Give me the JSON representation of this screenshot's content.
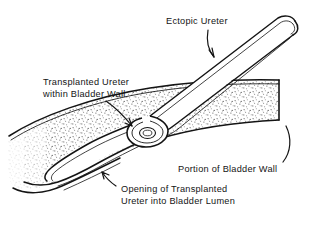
{
  "figure": {
    "background_color": "#ffffff",
    "ink_color": "#141414",
    "stipple_color": "#6b6b6b",
    "style": "black-and-white medical line drawing with stippled shading"
  },
  "labels": {
    "ectopic_ureter": "Ectopic Ureter",
    "transplanted_line1": "Transplanted Ureter",
    "transplanted_line2": "within Bladder Wall",
    "portion_of_bladder_wall": "Portion of Bladder Wall",
    "opening_line1": "Opening of Transplanted",
    "opening_line2": "Ureter into Bladder Lumen"
  },
  "structures": {
    "ectopic_ureter": "tubular duct descending from upper right with rounded closed cut end",
    "bladder_wall": "stippled band curving from lower left to cut edge at right",
    "transplanted_segment": "ureter tunneled within the bladder wall",
    "ureteral_opening": "hairpin loop where ureter opens into bladder lumen"
  },
  "leaders": [
    {
      "name": "ectopic-ureter-leader",
      "from": "Ectopic Ureter",
      "to": "ureter tube",
      "arrow": true
    },
    {
      "name": "transplanted-ureter-leader",
      "from": "Transplanted Ureter within Bladder Wall",
      "to": "intramural tunnel",
      "arrow": true
    },
    {
      "name": "bladder-wall-leader",
      "from": "Portion of Bladder Wall",
      "to": "cut edge of wall",
      "arrow": false
    },
    {
      "name": "opening-leader",
      "from": "Opening of Transplanted Ureter into Bladder Lumen",
      "to": "hairpin loop opening",
      "arrow": true
    }
  ]
}
